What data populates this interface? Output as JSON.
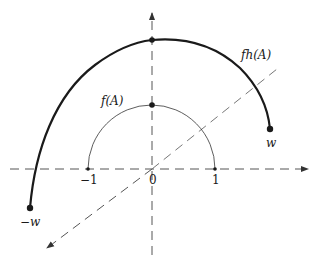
{
  "diagram": {
    "axes": {
      "horizontal": {
        "x1": 10,
        "y1": 169,
        "x2": 308,
        "y2": 169
      },
      "vertical": {
        "x1": 152,
        "y1": 255,
        "x2": 152,
        "y2": 13
      },
      "diagonal": {
        "x1": 277,
        "y1": 69,
        "x2": 47,
        "y2": 248
      }
    },
    "curves": {
      "inner": {
        "name": "f(A)",
        "cx": 152,
        "cy": 169,
        "rx": 63,
        "ry": 64
      },
      "outer": {
        "name": "fh(A)",
        "start": [
          30,
          208
        ],
        "top": [
          152,
          40
        ],
        "end": [
          270,
          129
        ]
      }
    },
    "points": [
      {
        "id": "origin",
        "x": 152,
        "y": 169
      },
      {
        "id": "one",
        "x": 215,
        "y": 169
      },
      {
        "id": "neg-one",
        "x": 88,
        "y": 169
      },
      {
        "id": "f-top",
        "x": 152,
        "y": 105
      },
      {
        "id": "fh-top",
        "x": 152,
        "y": 40
      },
      {
        "id": "w",
        "x": 270,
        "y": 129
      },
      {
        "id": "neg-w",
        "x": 30,
        "y": 208
      }
    ],
    "labels": {
      "f_A": "f(A)",
      "fh_A": "fh(A)",
      "zero": "0",
      "one": "1",
      "neg_one": "−1",
      "w": "w",
      "neg_w": "−w"
    },
    "colors": {
      "line": "#1a1a1a",
      "dashed": "#555555",
      "background": "#ffffff"
    }
  }
}
